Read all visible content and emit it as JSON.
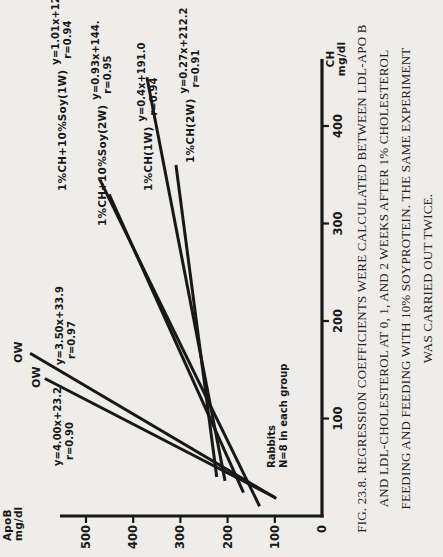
{
  "page": {
    "background": "#efede9",
    "ink": "#181818"
  },
  "caption": {
    "lines": [
      "FIG. 23.8. REGRESSION COEFFICIENTS WERE CALCULATED BETWEEN LDL-APO B",
      "AND LDL-CHOLESTEROL AT 0, 1, AND 2 WEEKS AFTER 1% CHOLESTEROL",
      "FEEDING AND FEEDING WITH 10% SOYPROTEIN. THE SAME EXPERIMENT",
      "WAS CARRIED OUT TWICE."
    ]
  },
  "chart_data": {
    "type": "line",
    "title": "",
    "xlabel": "CH mg/dl",
    "ylabel": "ApoB mg/dl",
    "xlabel_lines": [
      "CH",
      "mg/dl"
    ],
    "ylabel_lines": [
      "ApoB",
      "mg/dl"
    ],
    "x_ticks": [
      100,
      200,
      300,
      400
    ],
    "y_ticks": [
      0,
      100,
      200,
      300,
      400,
      500
    ],
    "xlim": [
      0,
      469
    ],
    "ylim": [
      0,
      553
    ],
    "grid": false,
    "annotation_lines": [
      "Rabbits",
      "N=8 in each group"
    ],
    "series": [
      {
        "name": "OW",
        "equation": "y=3.50x+33.9",
        "r_label": "r=0.97",
        "slope": 3.5,
        "intercept": 33.9,
        "r": 0.97,
        "x_range": [
          18,
          167
        ]
      },
      {
        "name": "OW",
        "equation": "y=4.00x+23.2",
        "r_label": "r=0.90",
        "slope": 4.0,
        "intercept": 23.2,
        "r": 0.9,
        "x_range": [
          19,
          141
        ]
      },
      {
        "name": "1%CH+10%Soy(1W)",
        "equation": "y=1.01x+122.1",
        "r_label": "r=0.94",
        "slope": 1.01,
        "intercept": 122.1,
        "r": 0.94,
        "x_range": [
          10,
          345
        ]
      },
      {
        "name": "1%CH+10%Soy(2W)",
        "equation": "y=0.93x+144.",
        "r_label": "r=0.95",
        "slope": 0.93,
        "intercept": 144,
        "r": 0.95,
        "x_range": [
          24,
          330
        ]
      },
      {
        "name": "1%CH(1W)",
        "equation": "y=0.4x+191.0",
        "r_label": "r=0.94",
        "slope": 0.4,
        "intercept": 191.0,
        "r": 0.94,
        "x_range": [
          36,
          450
        ]
      },
      {
        "name": "1%CH(2W)",
        "equation": "y=0.27x+212.2",
        "r_label": "r=0.91",
        "slope": 0.27,
        "intercept": 212.2,
        "r": 0.91,
        "x_range": [
          40,
          360
        ]
      }
    ],
    "layout": {
      "rotation_deg": -90,
      "origin_px": [
        41,
        322
      ],
      "px_per_x": 0.975,
      "px_per_y": 0.472,
      "x_axis_end_px": 498,
      "y_axis_end_px": 60,
      "series_labels": [
        {
          "series": 0,
          "name_pos": [
            194,
            13
          ],
          "eq_pos": [
            192,
            54
          ]
        },
        {
          "series": 1,
          "name_pos": [
            169,
            31
          ],
          "eq_pos": [
            91,
            52
          ]
        },
        {
          "series": 2,
          "row_pos": [
            366,
            50
          ]
        },
        {
          "series": 3,
          "row_pos": [
            331,
            90
          ]
        },
        {
          "series": 4,
          "row_pos": [
            366,
            136
          ]
        },
        {
          "series": 5,
          "row_pos": [
            394,
            178
          ]
        }
      ],
      "annotation_pos": [
        89,
        266
      ],
      "xlabel_pos": [
        474,
        325
      ],
      "ylabel_pos": [
        16,
        2
      ]
    }
  }
}
